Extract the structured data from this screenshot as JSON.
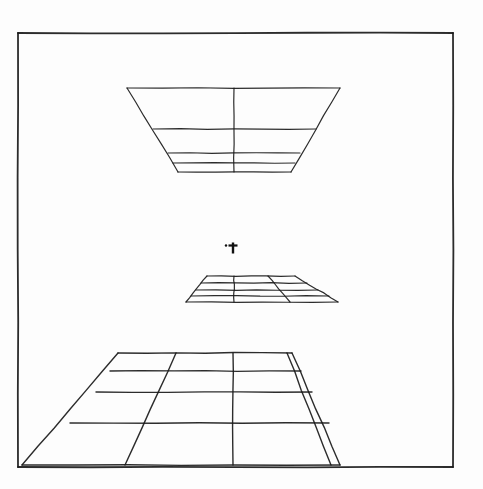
{
  "figure": {
    "title": "Three horizontal planes in one-point perspective",
    "background_color": "#fdfdfd",
    "ink_color": "#1a1a1a",
    "border": {
      "label": "plate border",
      "color": "#222222",
      "x": 18,
      "y": 33,
      "width": 435,
      "height": 434,
      "stroke_width": 1.8
    },
    "eye_level_marker": {
      "label": "cross marker at eye level",
      "glyph": "cross",
      "x": 233,
      "y": 248,
      "size": 11,
      "color": "#111111"
    },
    "planes": [
      {
        "id": "ceiling-plane",
        "label": "Overhead plane above eye level",
        "position": "above eye level",
        "stroke_width": 1.2,
        "outline": [
          [
            127,
            88
          ],
          [
            340,
            88
          ],
          [
            291,
            172
          ],
          [
            178,
            172
          ]
        ],
        "horizontal_lines": [
          [
            [
              127,
              88
            ],
            [
              340,
              88
            ]
          ],
          [
            [
              153,
              129
            ],
            [
              316,
              129
            ]
          ],
          [
            [
              168,
              153
            ],
            [
              300,
              153
            ]
          ],
          [
            [
              173,
              163
            ],
            [
              295,
              163
            ]
          ],
          [
            [
              178,
              172
            ],
            [
              291,
              172
            ]
          ]
        ],
        "vertical_lines": [
          [
            [
              234,
              88
            ],
            [
              234,
              172
            ]
          ]
        ],
        "rows": 4,
        "columns": 2
      },
      {
        "id": "eye-level-plane",
        "label": "Small plane just below eye level",
        "position": "just below eye level",
        "stroke_width": 1.2,
        "outline": [
          [
            207,
            276
          ],
          [
            295,
            276
          ],
          [
            338,
            302
          ],
          [
            186,
            302
          ]
        ],
        "horizontal_lines": [
          [
            [
              207,
              276
            ],
            [
              295,
              276
            ]
          ],
          [
            [
              201,
              283
            ],
            [
              307,
              283
            ]
          ],
          [
            [
              196,
              290
            ],
            [
              318,
              290
            ]
          ],
          [
            [
              191,
              296
            ],
            [
              329,
              296
            ]
          ],
          [
            [
              186,
              302
            ],
            [
              338,
              302
            ]
          ]
        ],
        "vertical_lines": [
          [
            [
              234,
              276
            ],
            [
              234,
              302
            ]
          ],
          [
            [
              268,
              276
            ],
            [
              290,
              302
            ]
          ]
        ],
        "rows": 4,
        "columns": 3
      },
      {
        "id": "floor-plane",
        "label": "Large floor plane below eye level",
        "position": "below eye level",
        "stroke_width": 1.4,
        "outline": [
          [
            118,
            353
          ],
          [
            292,
            353
          ],
          [
            340,
            465
          ],
          [
            22,
            465
          ]
        ],
        "horizontal_lines": [
          [
            [
              118,
              353
            ],
            [
              292,
              353
            ]
          ],
          [
            [
              110,
              371
            ],
            [
              301,
              371
            ]
          ],
          [
            [
              96,
              392
            ],
            [
              312,
              392
            ]
          ],
          [
            [
              70,
              423
            ],
            [
              329,
              423
            ]
          ],
          [
            [
              22,
              465
            ],
            [
              340,
              465
            ]
          ]
        ],
        "vertical_lines": [
          [
            [
              176,
              353
            ],
            [
              125,
              465
            ]
          ],
          [
            [
              233,
              353
            ],
            [
              233,
              465
            ]
          ],
          [
            [
              287,
              353
            ],
            [
              331,
              465
            ]
          ]
        ],
        "rows": 4,
        "columns": 3
      }
    ]
  }
}
